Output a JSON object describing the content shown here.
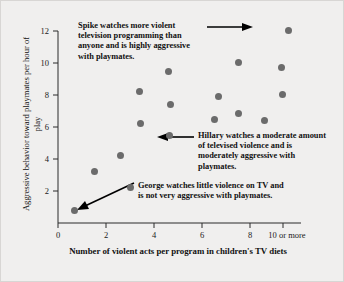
{
  "chart_data": {
    "type": "scatter",
    "title": "",
    "xlabel": "Number of violent acts per program in children's TV diets",
    "ylabel": "Aggressive behavior toward playmates per hour of play",
    "xlim": [
      0,
      10.5
    ],
    "ylim": [
      0,
      12.6
    ],
    "xticks": [
      0,
      2,
      4,
      6,
      8,
      10
    ],
    "xtick_labels": [
      "0",
      "2",
      "4",
      "6",
      "8",
      "10 or more"
    ],
    "yticks": [
      2,
      4,
      6,
      8,
      10,
      12
    ],
    "ytick_labels": [
      "2",
      "4",
      "6",
      "8",
      "10",
      "12"
    ],
    "grid": false,
    "legend": "none",
    "point_color": "#6b6b6b",
    "points": [
      {
        "x": 0.7,
        "y": 0.8,
        "name": "George"
      },
      {
        "x": 1.5,
        "y": 3.25
      },
      {
        "x": 2.6,
        "y": 4.25
      },
      {
        "x": 3.0,
        "y": 2.25
      },
      {
        "x": 3.4,
        "y": 8.2
      },
      {
        "x": 3.45,
        "y": 6.2
      },
      {
        "x": 4.6,
        "y": 9.45
      },
      {
        "x": 4.7,
        "y": 7.4
      },
      {
        "x": 4.65,
        "y": 5.5,
        "name": "Hillary"
      },
      {
        "x": 6.5,
        "y": 6.45
      },
      {
        "x": 6.7,
        "y": 7.9
      },
      {
        "x": 7.5,
        "y": 10.05
      },
      {
        "x": 7.5,
        "y": 6.85
      },
      {
        "x": 8.6,
        "y": 6.4
      },
      {
        "x": 9.3,
        "y": 9.7
      },
      {
        "x": 9.35,
        "y": 8.05
      },
      {
        "x": 9.6,
        "y": 12.05,
        "name": "Spike"
      }
    ]
  },
  "annotations": {
    "spike": "Spike watches more violent television programming than anyone and is highly aggressive with playmates.",
    "hillary": "Hillary watches a moderate amount of televised violence and is moderately aggressive with playmates.",
    "george": "George watches little violence on TV and is not very aggressive with playmates."
  }
}
